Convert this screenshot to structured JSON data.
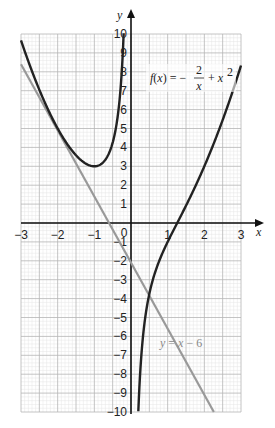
{
  "chart_data": {
    "type": "line",
    "title": "",
    "xlabel": "x",
    "ylabel": "y",
    "xlim": [
      -3,
      3
    ],
    "ylim": [
      -10,
      10
    ],
    "grid": true,
    "x_ticks": [
      "-3",
      "-2",
      "-1",
      "0",
      "1",
      "2",
      "3"
    ],
    "y_ticks": [
      "10",
      "9",
      "8",
      "7",
      "6",
      "5",
      "4",
      "3",
      "2",
      "1",
      "-1",
      "-2",
      "-3",
      "-4",
      "-5",
      "-6",
      "-7",
      "-8",
      "-9",
      "-10"
    ],
    "origin_label": "0",
    "series": [
      {
        "name": "f(x) = -2/x + x^2",
        "label_text_main": "f(x) = −",
        "label_frac_num": "2",
        "label_frac_den": "x",
        "label_tail": "+ x",
        "label_sup": "2",
        "color": "#222222",
        "branch_left": [
          [
            -3,
            9.67
          ],
          [
            -2.5,
            7.05
          ],
          [
            -2,
            5
          ],
          [
            -1.5,
            3.58
          ],
          [
            -1,
            3
          ],
          [
            -0.75,
            3.23
          ],
          [
            -0.5,
            4.25
          ],
          [
            -0.35,
            5.84
          ],
          [
            -0.25,
            8.06
          ],
          [
            -0.2,
            10.04
          ]
        ],
        "branch_right": [
          [
            0.2,
            -9.96
          ],
          [
            0.25,
            -7.94
          ],
          [
            0.35,
            -5.59
          ],
          [
            0.5,
            -3.75
          ],
          [
            0.75,
            -2.1
          ],
          [
            1,
            -1
          ],
          [
            1.26,
            0
          ],
          [
            1.5,
            0.92
          ],
          [
            2,
            3
          ],
          [
            2.5,
            5.45
          ],
          [
            3,
            8.33
          ]
        ]
      },
      {
        "name": "y = x − 6",
        "label_text": "y = x − 6",
        "color": "#999999",
        "points": [
          [
            -3,
            8.4
          ],
          [
            2.26,
            -10
          ]
        ]
      }
    ]
  }
}
